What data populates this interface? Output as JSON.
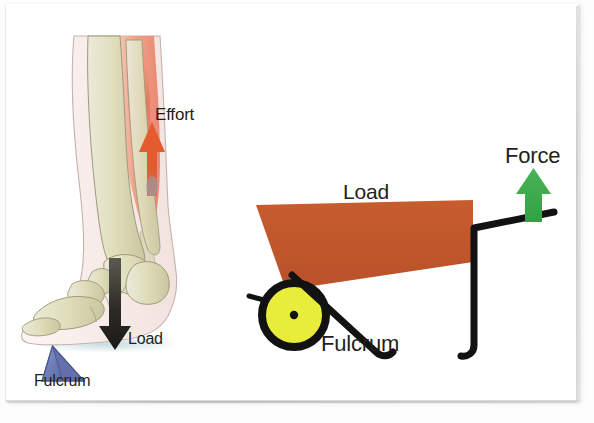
{
  "diagram": {
    "background_color": "#ffffff"
  },
  "left_panel": {
    "name": "foot-lever-illustration",
    "labels": {
      "effort": "Effort",
      "load": "Load",
      "fulcrum": "Fulcrum"
    },
    "colors": {
      "effort_arrow": "#e0522b",
      "load_arrow": "#231f20",
      "fulcrum_triangle": "#6d7bb3",
      "bone": "#d9d8b8",
      "muscle": "#e8826a",
      "skin_outline": "#b9a9a4"
    }
  },
  "right_panel": {
    "name": "wheelbarrow-lever-illustration",
    "labels": {
      "load": "Load",
      "fulcrum": "Fulcrum",
      "force": "Force"
    },
    "colors": {
      "barrow_tray": "#c0562b",
      "wheel_fill": "#e8ed3a",
      "wheel_outline": "#121212",
      "frame": "#121212",
      "force_arrow": "#3bab4a"
    }
  }
}
